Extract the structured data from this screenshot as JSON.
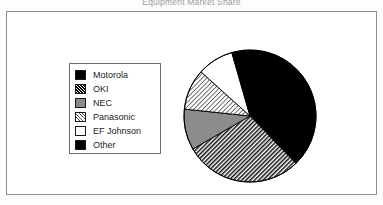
{
  "chart_title": "Equipment Market Share",
  "legend": {
    "items": [
      {
        "label": "Motorola",
        "swatch": "solid-black",
        "swatch_class": "fill-solid"
      },
      {
        "label": "OKI",
        "swatch": "dense-hatch",
        "swatch_class": "fill-hatch-dense"
      },
      {
        "label": "NEC",
        "swatch": "gray",
        "swatch_class": "fill-gray"
      },
      {
        "label": "Panasonic",
        "swatch": "light-hatch",
        "swatch_class": "fill-hatch-light"
      },
      {
        "label": "EF  Johnson",
        "swatch": "white",
        "swatch_class": "fill-white"
      },
      {
        "label": "Other",
        "swatch": "solid-black",
        "swatch_class": "fill-solid"
      }
    ]
  },
  "chart_data": {
    "type": "pie",
    "title": "Equipment Market Share",
    "xlabel": "",
    "ylabel": "",
    "legend_position": "left",
    "grid": false,
    "categories": [
      "Motorola",
      "OKI",
      "NEC",
      "Panasonic",
      "EF  Johnson",
      "Other"
    ],
    "values": [
      36,
      29,
      10,
      10,
      9,
      6
    ],
    "units": "percent",
    "start_angle_deg": 0,
    "direction": "clockwise",
    "slices": [
      {
        "name": "Motorola",
        "value": 36,
        "start_deg": 6,
        "end_deg": 136,
        "pattern": "solid-black",
        "color": "#000000"
      },
      {
        "name": "OKI",
        "value": 29,
        "start_deg": 136,
        "end_deg": 240,
        "pattern": "dense-diagonal-hatch",
        "color": "#2b2b2b"
      },
      {
        "name": "NEC",
        "value": 10,
        "start_deg": 240,
        "end_deg": 276,
        "pattern": "gray",
        "color": "#8c8c8c"
      },
      {
        "name": "Panasonic",
        "value": 10,
        "start_deg": 276,
        "end_deg": 312,
        "pattern": "light-diagonal-hatch",
        "color": "#c9c9c9"
      },
      {
        "name": "EF  Johnson",
        "value": 9,
        "start_deg": 312,
        "end_deg": 344,
        "pattern": "white",
        "color": "#ffffff"
      },
      {
        "name": "Other",
        "value": 6,
        "start_deg": 344,
        "end_deg": 366,
        "pattern": "solid-black",
        "color": "#000000"
      }
    ]
  },
  "colors": {
    "frame_border": "#8e8e8e",
    "legend_border": "#6d6d6d",
    "text": "#1c1c1c",
    "title_text": "#9a9a9a",
    "background": "#ffffff"
  }
}
